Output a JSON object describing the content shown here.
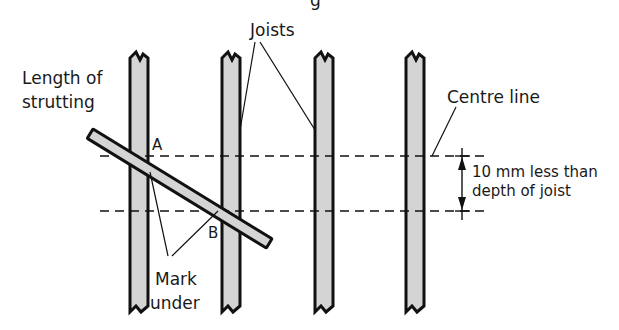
{
  "diagram": {
    "top_caption_fragment": "g",
    "labels": {
      "joists": "Joists",
      "length_line1": "Length of",
      "length_line2": "strutting",
      "centre_line": "Centre line",
      "point_a": "A",
      "point_b": "B",
      "mark_line1": "Mark",
      "mark_line2": "under",
      "dim_line1": "10 mm less than",
      "dim_line2": "depth of joist"
    },
    "colors": {
      "joist_fill": "#d4d4d4",
      "outline": "#111111",
      "background": "#ffffff"
    }
  }
}
